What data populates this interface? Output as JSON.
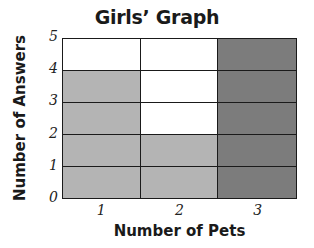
{
  "chart_data": {
    "type": "bar",
    "title": "Girls’ Graph",
    "xlabel": "Number of Pets",
    "ylabel": "Number of Answers",
    "categories": [
      "1",
      "2",
      "3"
    ],
    "values": [
      4,
      2,
      5
    ],
    "ylim": [
      0,
      5
    ],
    "yticks": [
      "0",
      "1",
      "2",
      "3",
      "4",
      "5"
    ],
    "grid": true,
    "style": "pictograph-grid (shaded squares)",
    "bar_colors": [
      "#b4b4b4",
      "#b4b4b4",
      "#7c7c7c"
    ]
  },
  "colors": {
    "empty": "#ffffff",
    "line": "#1a1a1a"
  }
}
